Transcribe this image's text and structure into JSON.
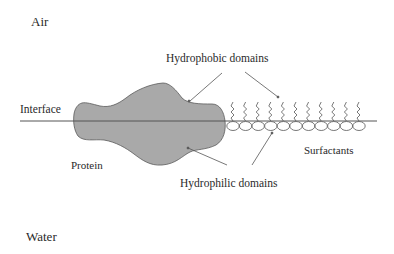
{
  "diagram": {
    "type": "schematic",
    "colors": {
      "protein_fill": "#a9a9a9",
      "protein_stroke": "#5a5a5a",
      "line": "#555555",
      "text": "#2a2a2a",
      "background": "#ffffff"
    },
    "phases": {
      "top": "Air",
      "bottom": "Water"
    },
    "labels": {
      "interface": "Interface",
      "hydrophobic": "Hydrophobic domains",
      "hydrophilic": "Hydrophilic domains",
      "protein": "Protein",
      "surfactants": "Surfactants"
    },
    "surfactant_count": 11
  }
}
